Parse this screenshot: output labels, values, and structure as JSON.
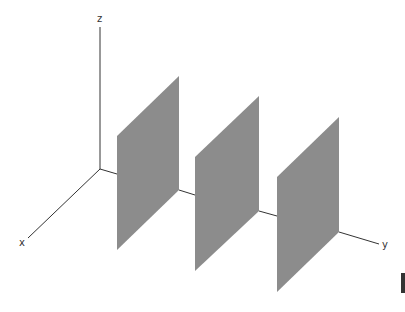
{
  "diagram": {
    "title": "",
    "axes": {
      "x": {
        "label": "x"
      },
      "y": {
        "label": "y"
      },
      "z": {
        "label": "z"
      }
    },
    "planes": [
      {
        "name": "plane-1",
        "orientation": "parallel to xz-plane",
        "position_index": 1
      },
      {
        "name": "plane-2",
        "orientation": "parallel to xz-plane",
        "position_index": 2
      },
      {
        "name": "plane-3",
        "orientation": "parallel to xz-plane",
        "position_index": 3
      }
    ],
    "colors": {
      "plane_fill": "#8c8c8c",
      "axis_stroke": "#333333",
      "marker": "#333333"
    }
  }
}
